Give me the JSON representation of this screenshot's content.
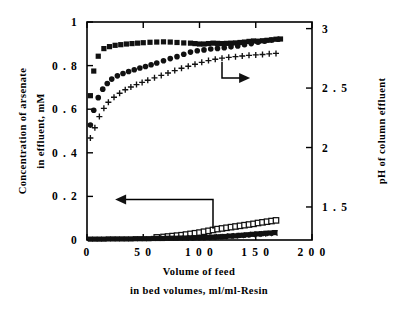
{
  "figure": {
    "background_color": "#ffffff",
    "ink_color": "#000000"
  },
  "chart_data": {
    "type": "scatter",
    "title": "",
    "subtitle": "",
    "xlabel_line1": "Volume of feed",
    "xlabel_line2": "in bed volumes, ml/ml-Resin",
    "ylabel_left_line1": "Concentration of arsenate",
    "ylabel_left_line2": "in effluent, mM",
    "ylabel_right": "pH of column effluent",
    "xlim": [
      0,
      200
    ],
    "ylim_left": [
      0,
      1
    ],
    "ylim_right": [
      1.2222,
      3.0556
    ],
    "xticks": [
      0,
      50,
      100,
      150,
      200
    ],
    "xtick_labels": [
      "0",
      "5 0",
      "1 0 0",
      "1 5 0",
      "2 0 0"
    ],
    "yticks_left": [
      0,
      0.2,
      0.4,
      0.6,
      0.8,
      1
    ],
    "ytick_labels_left": [
      "0",
      "0 . 2",
      "0 . 4",
      "0 . 6",
      "0 . 8",
      "1"
    ],
    "yticks_right": [
      1.5,
      2,
      2.5,
      3
    ],
    "ytick_labels_right": [
      "1 . 5",
      "2",
      "2 . 5",
      "3"
    ],
    "grid": false,
    "legend": "none",
    "annotations": [
      {
        "name": "arrow-to-left-axis",
        "direction": "left",
        "label": "",
        "tip_x": 25,
        "y_left": 0.186,
        "elbow_x": 112,
        "elbow_y_left": 0.052
      },
      {
        "name": "arrow-to-right-axis",
        "direction": "right",
        "label": "",
        "tip_x": 145,
        "y_left": 0.743,
        "elbow_x": 120,
        "elbow_y_left": 0.817
      }
    ],
    "series": [
      {
        "name": "pH - run A",
        "axis": "right",
        "marker": "filled-square",
        "x": [
          3,
          6,
          10,
          15,
          20,
          25,
          30,
          35,
          40,
          45,
          50,
          56,
          62,
          68,
          74,
          80,
          86,
          92,
          96,
          100,
          104,
          108,
          112,
          116,
          120,
          124,
          128,
          132,
          136,
          140,
          144,
          148,
          152,
          156,
          160,
          164,
          168,
          172
        ],
        "y_left_equiv": [
          0.662,
          0.775,
          0.843,
          0.878,
          0.887,
          0.893,
          0.896,
          0.899,
          0.901,
          0.903,
          0.905,
          0.907,
          0.908,
          0.909,
          0.908,
          0.906,
          0.904,
          0.903,
          0.901,
          0.899,
          0.899,
          0.901,
          0.903,
          0.902,
          0.901,
          0.902,
          0.903,
          0.904,
          0.906,
          0.908,
          0.911,
          0.913,
          0.912,
          0.914,
          0.916,
          0.918,
          0.921,
          0.922
        ],
        "y_ph": [
          2.43,
          2.64,
          2.76,
          2.83,
          2.84,
          2.86,
          2.86,
          2.87,
          2.87,
          2.87,
          2.88,
          2.88,
          2.88,
          2.88,
          2.88,
          2.88,
          2.88,
          2.87,
          2.87,
          2.87,
          2.87,
          2.87,
          2.88,
          2.87,
          2.87,
          2.87,
          2.88,
          2.88,
          2.88,
          2.89,
          2.89,
          2.89,
          2.89,
          2.9,
          2.9,
          2.91,
          2.91,
          2.91
        ]
      },
      {
        "name": "pH - run B",
        "axis": "right",
        "marker": "filled-circle",
        "x": [
          3,
          6,
          10,
          14,
          18,
          22,
          27,
          32,
          37,
          42,
          47,
          52,
          57,
          62,
          68,
          74,
          80,
          86,
          92,
          98,
          104,
          110,
          116,
          122,
          128,
          134,
          140,
          146,
          152,
          158,
          164,
          170
        ],
        "y_left_equiv": [
          0.527,
          0.595,
          0.653,
          0.692,
          0.718,
          0.738,
          0.753,
          0.764,
          0.773,
          0.781,
          0.789,
          0.796,
          0.804,
          0.812,
          0.822,
          0.832,
          0.841,
          0.852,
          0.862,
          0.868,
          0.872,
          0.876,
          0.879,
          0.882,
          0.886,
          0.89,
          0.896,
          0.901,
          0.907,
          0.912,
          0.917,
          0.921
        ],
        "y_ph": [
          2.19,
          2.31,
          2.42,
          2.49,
          2.54,
          2.57,
          2.6,
          2.62,
          2.64,
          2.65,
          2.67,
          2.68,
          2.69,
          2.71,
          2.73,
          2.74,
          2.76,
          2.78,
          2.8,
          2.81,
          2.82,
          2.83,
          2.83,
          2.84,
          2.85,
          2.85,
          2.86,
          2.87,
          2.88,
          2.89,
          2.9,
          2.91
        ]
      },
      {
        "name": "pH - run C",
        "axis": "right",
        "marker": "plus",
        "x": [
          3,
          7,
          11,
          15,
          19,
          24,
          29,
          34,
          39,
          44,
          49,
          54,
          60,
          66,
          72,
          78,
          84,
          90,
          96,
          102,
          108,
          114,
          120,
          126,
          132,
          138,
          144,
          150,
          156,
          162,
          168
        ],
        "y_left_equiv": [
          0.468,
          0.515,
          0.566,
          0.604,
          0.632,
          0.655,
          0.673,
          0.689,
          0.702,
          0.713,
          0.723,
          0.733,
          0.744,
          0.755,
          0.766,
          0.777,
          0.788,
          0.797,
          0.806,
          0.815,
          0.823,
          0.829,
          0.834,
          0.838,
          0.841,
          0.844,
          0.847,
          0.849,
          0.851,
          0.854,
          0.856
        ],
        "y_ph": [
          2.08,
          2.17,
          2.26,
          2.33,
          2.38,
          2.42,
          2.46,
          2.49,
          2.51,
          2.53,
          2.55,
          2.57,
          2.59,
          2.61,
          2.63,
          2.65,
          2.67,
          2.68,
          2.7,
          2.72,
          2.73,
          2.74,
          2.75,
          2.76,
          2.77,
          2.77,
          2.78,
          2.78,
          2.79,
          2.79,
          2.8
        ]
      },
      {
        "name": "arsenate concentration - open squares",
        "axis": "left",
        "marker": "open-square",
        "x": [
          62,
          68,
          72,
          76,
          80,
          84,
          88,
          92,
          96,
          100,
          104,
          108,
          112,
          116,
          120,
          124,
          128,
          132,
          136,
          140,
          144,
          148,
          152,
          156,
          160,
          164,
          168
        ],
        "y": [
          0.012,
          0.014,
          0.016,
          0.018,
          0.02,
          0.022,
          0.025,
          0.028,
          0.031,
          0.034,
          0.038,
          0.042,
          0.046,
          0.05,
          0.053,
          0.056,
          0.059,
          0.062,
          0.065,
          0.068,
          0.071,
          0.074,
          0.078,
          0.081,
          0.084,
          0.087,
          0.09
        ]
      },
      {
        "name": "arsenate concentration - filled squares",
        "axis": "left",
        "marker": "filled-square",
        "x": [
          3,
          7,
          11,
          15,
          19,
          23,
          27,
          31,
          35,
          39,
          43,
          47,
          51,
          55,
          59,
          63,
          67,
          71,
          75,
          79,
          83,
          87,
          91,
          95,
          99,
          103,
          107,
          111,
          115,
          119,
          123,
          127,
          131,
          135,
          139,
          143,
          147,
          151,
          155,
          159,
          163,
          167
        ],
        "y": [
          0.004,
          0.004,
          0.004,
          0.004,
          0.005,
          0.005,
          0.005,
          0.005,
          0.005,
          0.005,
          0.006,
          0.006,
          0.006,
          0.006,
          0.007,
          0.007,
          0.007,
          0.008,
          0.008,
          0.008,
          0.009,
          0.009,
          0.01,
          0.01,
          0.011,
          0.011,
          0.012,
          0.013,
          0.014,
          0.015,
          0.016,
          0.018,
          0.019,
          0.021,
          0.022,
          0.024,
          0.026,
          0.028,
          0.029,
          0.031,
          0.032,
          0.034
        ]
      },
      {
        "name": "arsenate concentration - crosses",
        "axis": "left",
        "marker": "cross",
        "x": [
          92,
          97,
          102,
          107,
          112,
          117,
          122,
          127,
          132,
          137,
          142,
          147,
          152,
          157,
          162,
          167
        ],
        "y": [
          0.009,
          0.01,
          0.011,
          0.012,
          0.013,
          0.015,
          0.016,
          0.018,
          0.019,
          0.021,
          0.023,
          0.025,
          0.026,
          0.028,
          0.03,
          0.032
        ]
      }
    ]
  }
}
